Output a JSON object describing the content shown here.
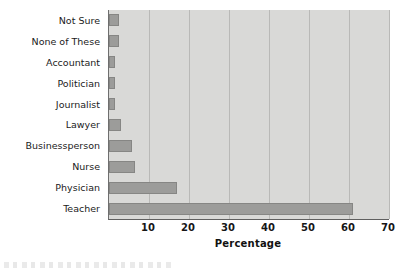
{
  "chart_data": {
    "type": "bar",
    "orientation": "horizontal",
    "title": "",
    "xlabel": "Percentage",
    "ylabel": "",
    "xlim": [
      0,
      70
    ],
    "ylim": null,
    "grid": true,
    "legend": false,
    "xticks": [
      0,
      10,
      20,
      30,
      40,
      50,
      60,
      70
    ],
    "xticklabels": [
      "",
      "10",
      "20",
      "30",
      "40",
      "50",
      "60",
      "70"
    ],
    "categories": [
      "Not Sure",
      "None of These",
      "Accountant",
      "Politician",
      "Journalist",
      "Lawyer",
      "Businessperson",
      "Nurse",
      "Physician",
      "Teacher"
    ],
    "values": [
      2.4,
      2.5,
      1.5,
      1.5,
      1.5,
      3.0,
      5.7,
      6.5,
      17.0,
      61.0
    ],
    "series": [
      {
        "name": "Percentage",
        "values": [
          2.4,
          2.5,
          1.5,
          1.5,
          1.5,
          3.0,
          5.7,
          6.5,
          17.0,
          61.0
        ]
      }
    ],
    "colors": {
      "bar_fill": "#9c9c9a",
      "bar_edge": "#868684",
      "plot_background": "#d9d9d7",
      "gridline": "#b9b9b7",
      "axis_line": "#5f5f5f",
      "text": "#1b1b1b",
      "page_background": "#ffffff"
    }
  }
}
